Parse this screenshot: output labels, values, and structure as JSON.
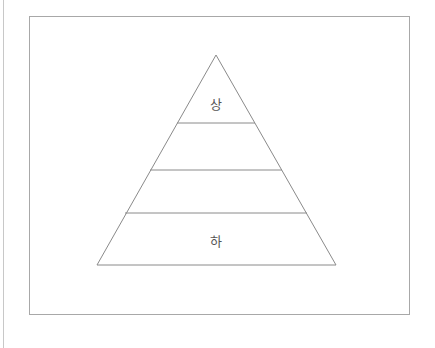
{
  "diagram": {
    "type": "pyramid",
    "levels": 4,
    "labels": {
      "top": "상",
      "bottom": "하"
    },
    "line_color": "#8a8a8a"
  }
}
